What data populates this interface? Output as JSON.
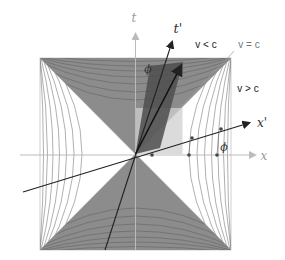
{
  "diagram": {
    "axes": {
      "t": {
        "label": "t"
      },
      "x": {
        "label": "x"
      },
      "t_prime": {
        "label": "t'"
      },
      "x_prime": {
        "label": "x'"
      }
    },
    "angle_label": "ϕ",
    "regions": {
      "timelike": "v < c",
      "lightlike": "v = c",
      "spacelike": "v > c"
    },
    "colors": {
      "timelike_fill": "#8c8c8c",
      "spacelike_fill": "#ffffff",
      "hyperbola_stroke": "#6a6a6a",
      "boosted_parallelogram": "#5a5a5a",
      "light_rect": "#c8c8c8",
      "axis_gray": "#bbbbbb",
      "axis_dark": "#222222"
    }
  }
}
